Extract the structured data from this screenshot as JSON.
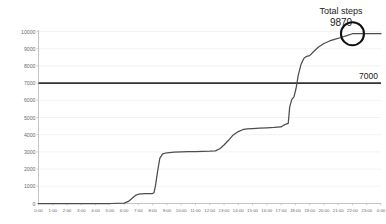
{
  "chart_data": {
    "type": "line",
    "title": "",
    "xlabel": "",
    "ylabel": "",
    "ylim": [
      0,
      10000
    ],
    "ytick_values": [
      0,
      1000,
      2000,
      3000,
      4000,
      5000,
      6000,
      7000,
      8000,
      9000,
      10000
    ],
    "ytick_labels": [
      "0",
      "1000",
      "2000",
      "3000",
      "4000",
      "5000",
      "6000",
      "7000",
      "8000",
      "9000",
      "10000"
    ],
    "xtick_labels": [
      "0:00",
      "1:00",
      "2:00",
      "3:00",
      "4:00",
      "5:00",
      "6:00",
      "7:00",
      "8:00",
      "9:00",
      "10:00",
      "11:00",
      "12:00",
      "13:00",
      "14:00",
      "15:00",
      "16:00",
      "17:00",
      "18:00",
      "19:00",
      "20:00",
      "21:00",
      "22:00",
      "23:00",
      "0:00"
    ],
    "grid": true,
    "legend": "none",
    "line_color": "#4d4d4d",
    "reference_line": {
      "value": 7000,
      "label": "7000",
      "color": "#333333"
    },
    "annotation": {
      "title": "Total steps",
      "value": "9870",
      "marker": "circle-highlight",
      "at_x_hour": 22,
      "at_y_value": 9870
    },
    "series": [
      {
        "name": "Cumulative steps",
        "x": [
          0,
          1,
          2,
          3,
          4,
          5,
          6,
          6.3,
          6.6,
          6.8,
          7.0,
          7.2,
          7.5,
          8.0,
          8.1,
          8.2,
          8.35,
          8.5,
          8.7,
          9.0,
          9.5,
          10.0,
          10.5,
          11.0,
          11.5,
          12.0,
          12.4,
          12.7,
          13.0,
          13.3,
          13.6,
          14.0,
          14.3,
          14.6,
          15.0,
          15.5,
          16.0,
          16.5,
          17.0,
          17.2,
          17.35,
          17.5,
          17.6,
          17.75,
          17.9,
          18.05,
          18.2,
          18.4,
          18.6,
          18.8,
          19.0,
          19.3,
          19.6,
          20.0,
          20.4,
          20.8,
          21.2,
          21.6,
          22.0,
          22.5,
          23.0,
          24.0
        ],
        "y": [
          0,
          0,
          0,
          0,
          0,
          0,
          20,
          120,
          330,
          470,
          540,
          560,
          570,
          580,
          640,
          1050,
          1900,
          2620,
          2880,
          2950,
          2980,
          3000,
          3010,
          3020,
          3030,
          3040,
          3060,
          3180,
          3400,
          3660,
          3950,
          4180,
          4290,
          4340,
          4360,
          4380,
          4400,
          4420,
          4450,
          4560,
          4620,
          4660,
          5600,
          6050,
          6200,
          6700,
          7450,
          8100,
          8450,
          8560,
          8600,
          8850,
          9080,
          9300,
          9450,
          9560,
          9650,
          9760,
          9870,
          9870,
          9870,
          9870
        ]
      }
    ]
  },
  "axes": {
    "y_axis_name": "steps-axis",
    "x_axis_name": "time-axis"
  }
}
